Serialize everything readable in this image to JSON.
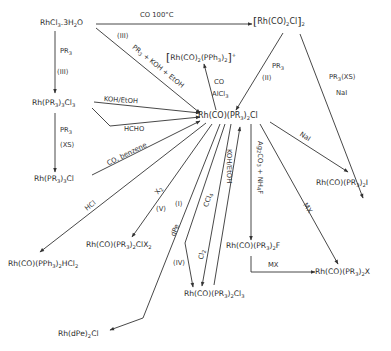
{
  "diagram": {
    "type": "reaction-scheme",
    "colors": {
      "line": "#333333",
      "text": "#2b2b2b",
      "background": "#ffffff"
    },
    "compounds": {
      "rhcl3": "RhCl3.3H2O",
      "dimer": "[Rh(CO)2Cl]2",
      "cation": "[Rh(CO)2(PPh3)2]+",
      "rhpr3cl3": "Rh(PR3)3Cl3",
      "center": "Rh(CO)(PR3)2Cl",
      "rhpr3cl": "Rh(PR3)3Cl",
      "iodide": "Rh(CO)(PR3)2I",
      "hcl2": "Rh(CO)(PPh3)2HCl2",
      "clx2": "Rh(CO)(PR3)2ClX2",
      "fluoride": "Rh(CO)(PR3)2F",
      "halide": "Rh(CO)(PR3)2X",
      "cl3": "Rh(CO)(PR3)2Cl3",
      "dpe": "Rh(dPe)2Cl"
    },
    "conditions": {
      "co_100": "CO  100°C",
      "pr3_koh_etoh": "PR3 + KOH + EtOH",
      "roman_iii_a": "(III)",
      "pr3_a": "PR3",
      "roman_iii_b": "(III)",
      "pr3_xs_left": "PR3",
      "xs_left": "(XS)",
      "koh_etoh_left": "KOH/EtOH",
      "hcho": "HCHO",
      "co_benzene": "CO, benzene",
      "hcl": "HCl",
      "x2": "X2",
      "roman_v": "(V)",
      "roman_i": "(I)",
      "dpe": "dPe",
      "roman_iv": "(IV)",
      "ccl4": "CCl4",
      "cl2": "Cl2",
      "koh_etoh_up": "KOH/EtOH",
      "ag2co3": "Ag2CO3 + NH4F",
      "mx_center": "MX",
      "mx_bottom": "MX",
      "nai_center": "NaI",
      "co_alcl3_co": "CO",
      "co_alcl3_al": "AlCl3",
      "pr3_ii": "PR3",
      "roman_ii": "(II)",
      "pr3_xs_right": "PR3(XS)",
      "nai_right": "NaI"
    }
  }
}
